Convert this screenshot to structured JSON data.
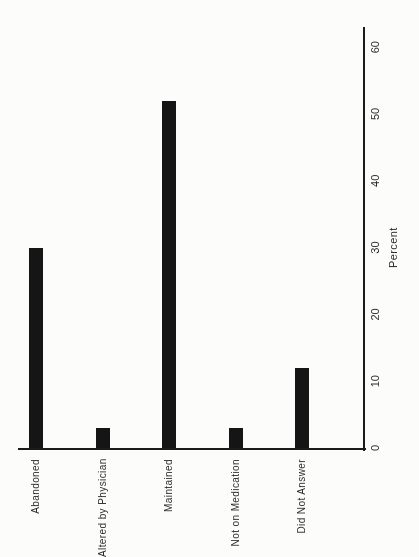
{
  "figure": {
    "kind": "scanned statistical figure, rotated 90 degrees on page",
    "background_color": "#fcfcfb",
    "ink_color": "#1b1b1b",
    "bar_color": "#151515"
  },
  "chart_data": {
    "type": "bar",
    "title": "",
    "orientation": "landscape chart rotated 90deg CCW on portrait page (bars read as horizontal bars after rotating page clockwise)",
    "categories": [
      "Abandoned",
      "Altered by Physician",
      "Maintained",
      "Not on Medication",
      "Did Not Answer"
    ],
    "values": [
      30,
      3,
      52,
      3,
      12
    ],
    "value_axis": {
      "label": "Percent",
      "min": 0,
      "max": 60,
      "ticks": [
        0,
        10,
        20,
        30,
        40,
        50,
        60
      ]
    },
    "grid": false,
    "legend": false,
    "data_labels": false
  }
}
